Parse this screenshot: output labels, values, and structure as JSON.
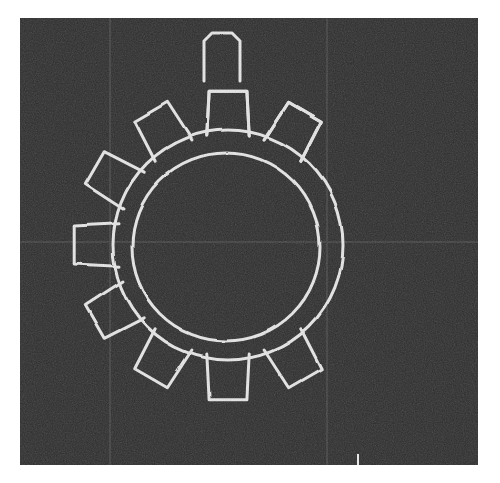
{
  "figure": {
    "kind": "technical-sketch",
    "panel": {
      "x": 20,
      "y": 18,
      "width": 458,
      "height": 447,
      "background_color": "#2d2d2d",
      "page_background_color": "#ffffff",
      "texture": "noise"
    },
    "stroke": {
      "color": "#e6e6e6",
      "width": 3,
      "linejoin": "round",
      "linecap": "round"
    },
    "grid": {
      "visible": true,
      "color": "#3f3f3f",
      "vertical_x": [
        110,
        327
      ],
      "horizontal_y": [
        242
      ]
    },
    "gear": {
      "label": "gear",
      "center_x": 228,
      "center_y": 245,
      "outer_radius": 115,
      "inner_radius": 94,
      "tooth_count": 12,
      "tooth_shape": "trapezoid-pentagon",
      "tooth_height": 40,
      "tooth_half_angle_deg": 11,
      "tooth_top_half_angle_deg": 7,
      "teeth_arc_start_deg": 52,
      "teeth_arc_end_deg": 308,
      "teeth_side": "left",
      "note": "teeth rendered only on the left hemisphere; right arc is bare"
    },
    "detached_tooth": {
      "label": "floating-tooth",
      "center_x": 222,
      "center_y": 57,
      "width": 36,
      "height": 48,
      "note": "isolated tooth outline drawn above the topmost gear tooth"
    },
    "tick_mark": {
      "label": "baseline-tick",
      "x": 357,
      "y": 454,
      "width": 2,
      "height": 11,
      "color": "#e8e8e8"
    }
  }
}
